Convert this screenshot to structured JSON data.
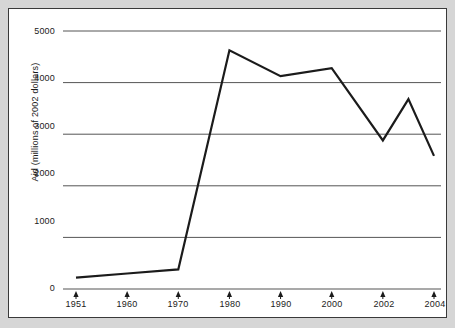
{
  "chart_data": {
    "type": "line",
    "title": "",
    "xlabel": "",
    "ylabel": "Aid (millions of 2002 dollars)",
    "categories": [
      "1951",
      "1960",
      "1970",
      "1980",
      "1990",
      "2000",
      "2002",
      "2003",
      "2004"
    ],
    "x_tick_labels": [
      "1951",
      "1960",
      "1970",
      "1980",
      "1990",
      "2000",
      "2002",
      "2004"
    ],
    "y_tick_labels": [
      "0",
      "1000",
      "2000",
      "3000",
      "4000",
      "5000"
    ],
    "y_ticks": [
      0,
      1000,
      2000,
      3000,
      4000,
      5000
    ],
    "ylim": [
      0,
      5000
    ],
    "grid": "horizontal",
    "legend": "none",
    "series": [
      {
        "name": "Aid",
        "color": "#1b1b1b",
        "points": [
          {
            "x": "1951",
            "value": 220
          },
          {
            "x": "1960",
            "value": 300
          },
          {
            "x": "1970",
            "value": 380
          },
          {
            "x": "1980",
            "value": 4625
          },
          {
            "x": "1990",
            "value": 4125
          },
          {
            "x": "2000",
            "value": 4280
          },
          {
            "x": "2002",
            "value": 2880
          },
          {
            "x": "2003",
            "value": 3680
          },
          {
            "x": "2004",
            "value": 2580
          }
        ]
      }
    ]
  },
  "axis": {
    "y_labels": [
      "5000",
      "4000",
      "3000",
      "2000",
      "1000",
      "0"
    ],
    "x_labels": [
      "1951",
      "1960",
      "1970",
      "1980",
      "1990",
      "2000",
      "2002",
      "2004"
    ],
    "y_title": "Aid (millions of 2002 dollars)"
  },
  "style": {
    "page_background": "#d6d6d6",
    "frame_background": "#ffffff",
    "frame_border": "#3a3a3a",
    "gridline_color": "#555555",
    "line_color": "#1b1b1b",
    "tick_color": "#1b1b1b"
  }
}
